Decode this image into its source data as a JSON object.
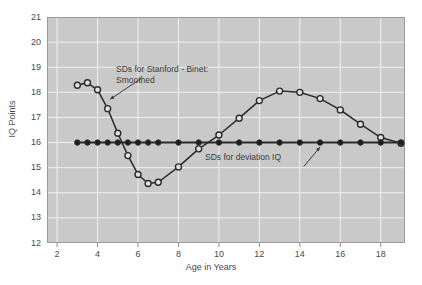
{
  "chart_data": {
    "type": "line",
    "title": "",
    "xlabel": "Age in Years",
    "ylabel": "IQ Points",
    "xlim": [
      1.5,
      19.2
    ],
    "ylim": [
      12,
      21
    ],
    "xticks": [
      2,
      4,
      6,
      8,
      10,
      12,
      14,
      16,
      18
    ],
    "yticks": [
      12,
      13,
      14,
      15,
      16,
      17,
      18,
      19,
      20,
      21
    ],
    "grid": true,
    "legend": "none",
    "background": "#c9c9c9",
    "gridline_color": "#f0f0f0",
    "line_color": "#2b2b2b",
    "series": [
      {
        "name": "SDs for Stanford - Binet: Smoothed",
        "marker": "open-circle",
        "x": [
          3.0,
          3.5,
          4.0,
          4.5,
          5.0,
          5.5,
          6.0,
          6.5,
          7.0,
          8.0,
          9.0,
          10.0,
          11.0,
          12.0,
          13.0,
          14.0,
          15.0,
          16.0,
          17.0,
          18.0,
          19.0
        ],
        "values": [
          18.28,
          18.38,
          18.1,
          17.35,
          16.37,
          15.48,
          14.73,
          14.37,
          14.42,
          15.03,
          15.75,
          16.3,
          16.97,
          17.67,
          18.05,
          18.0,
          17.75,
          17.3,
          16.73,
          16.2,
          15.97
        ]
      },
      {
        "name": "SDs for deviation IQ",
        "marker": "filled-circle",
        "x": [
          3.0,
          3.5,
          4.0,
          4.5,
          5.0,
          5.5,
          6.0,
          6.5,
          7.0,
          8.0,
          9.0,
          10.0,
          11.0,
          12.0,
          13.0,
          14.0,
          15.0,
          16.0,
          17.0,
          18.0,
          19.0
        ],
        "values": [
          16,
          16,
          16,
          16,
          16,
          16,
          16,
          16,
          16,
          16,
          16,
          16,
          16,
          16,
          16,
          16,
          16,
          16,
          16,
          16,
          16
        ]
      }
    ],
    "annotations": [
      {
        "id": "binet-label",
        "lines": [
          "SDs for Stanford - Binet:",
          "Smoothed"
        ],
        "arrow_from": [
          6.15,
          18.55
        ],
        "arrow_to": [
          4.62,
          17.72
        ]
      },
      {
        "id": "deviation-label",
        "lines": [
          "SDs for deviation IQ"
        ],
        "arrow_from": [
          14.2,
          15.05
        ],
        "arrow_to": [
          15.0,
          15.82
        ]
      }
    ]
  }
}
